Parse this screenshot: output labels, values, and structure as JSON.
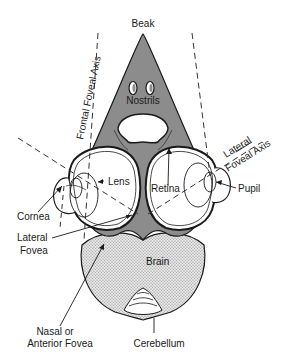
{
  "diagram": {
    "colors": {
      "beak_fill": "#8c8c8c",
      "brain_fill": "#d8d8d8",
      "outline": "#1a1a1a",
      "eye_fill": "#ffffff",
      "background": "#ffffff"
    },
    "labels": {
      "beak": "Beak",
      "nostrils": "Nostrils",
      "frontal_foveal_axis": "Frontal Foveal Axis",
      "lateral_foveal_axis_line1": "Lateral",
      "lateral_foveal_axis_line2": "Foveal Axis",
      "lens": "Lens",
      "retina": "Retina",
      "cornea": "Cornea",
      "pupil": "Pupil",
      "lateral_fovea_line1": "Lateral",
      "lateral_fovea_line2": "Fovea",
      "brain": "Brain",
      "nasal_fovea_line1": "Nasal or",
      "nasal_fovea_line2": "Anterior Fovea",
      "cerebellum": "Cerebellum"
    }
  }
}
